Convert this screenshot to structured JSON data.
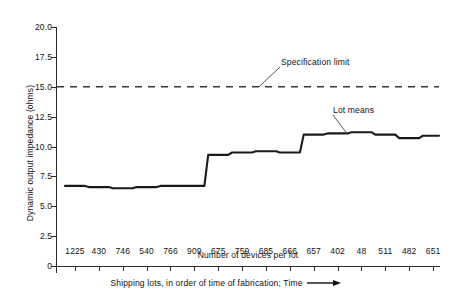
{
  "chart_data": {
    "type": "line",
    "title": "",
    "xlabel": "Shipping lots, in order of time of fabrication; Time",
    "xlabel_inner": "Number of devices per lot",
    "ylabel": "Dynamic output impedance (ohms)",
    "categories": [
      "1225",
      "430",
      "746",
      "540",
      "766",
      "909",
      "675",
      "759",
      "685",
      "666",
      "657",
      "402",
      "48",
      "511",
      "482",
      "651"
    ],
    "values": [
      6.7,
      6.6,
      6.5,
      6.6,
      6.7,
      6.7,
      9.3,
      9.5,
      9.6,
      9.5,
      11.0,
      11.1,
      11.2,
      11.0,
      10.7,
      10.9
    ],
    "series": [
      {
        "name": "Lot means",
        "values": [
          6.7,
          6.6,
          6.5,
          6.6,
          6.7,
          6.7,
          9.3,
          9.5,
          9.6,
          9.5,
          11.0,
          11.1,
          11.2,
          11.0,
          10.7,
          10.9
        ]
      }
    ],
    "reference_lines": [
      {
        "name": "Specification limit",
        "value": 15.0,
        "style": "dashed"
      }
    ],
    "annotations": [
      {
        "text": "Specification limit",
        "points_to_value": 15.0
      },
      {
        "text": "Lot means",
        "points_to_value": 11.2
      }
    ],
    "ylim": [
      0,
      20.0
    ],
    "yticks": [
      "0",
      "2.5",
      "5.0",
      "7.5",
      "10.0",
      "12.5",
      "15.0",
      "17.5",
      "20.0"
    ],
    "ytick_values": [
      0,
      2.5,
      5.0,
      7.5,
      10.0,
      12.5,
      15.0,
      17.5,
      20.0
    ],
    "grid": false,
    "legend": "none",
    "line_color": "#1a1a1a",
    "reference_line_color": "#3a3a3a",
    "axis_color": "#2b2b2b"
  },
  "axes": {
    "y_title": "Dynamic output impedance (ohms)",
    "x_caption": "Shipping lots, in order of time of fabrication; Time",
    "x_inner_label": "Number of devices per lot"
  },
  "annotations": {
    "spec_limit": "Specification limit",
    "lot_means": "Lot means"
  }
}
